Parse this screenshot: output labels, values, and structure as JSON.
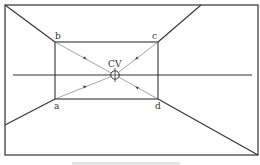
{
  "diagram": {
    "labels": {
      "b": "b",
      "c": "c",
      "a": "a",
      "d": "d",
      "cv": "CV"
    },
    "caption": "",
    "colors": {
      "line": "#333333",
      "thin_line": "#555555",
      "background": "#ffffff"
    },
    "geometry": {
      "outer_frame": [
        5,
        5,
        258,
        155
      ],
      "inner_rect": [
        55,
        42,
        158,
        99
      ],
      "center_of_vision": [
        115,
        75
      ],
      "horizon": {
        "y": 75,
        "x1": 13,
        "x2": 252
      }
    }
  }
}
